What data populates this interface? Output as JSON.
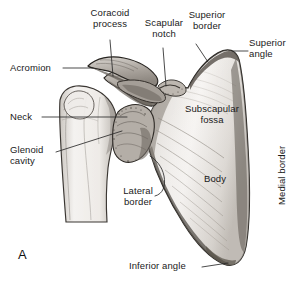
{
  "figure": {
    "panel_letter": "A",
    "background_color": "#ffffff",
    "ink_color": "#1a1a1a",
    "bone_fill": "#f2f0ee",
    "bone_shadow": "#9a958f",
    "leader_color": "#2a2a2a"
  },
  "labels": {
    "coracoid_process": "Coracoid\nprocess",
    "scapular_notch": "Scapular\nnotch",
    "superior_border": "Superior\nborder",
    "superior_angle": "Superior\nangle",
    "acromion": "Acromion",
    "neck": "Neck",
    "glenoid_cavity": "Glenoid\ncavity",
    "subscapular_fossa": "Subscapular\nfossa",
    "body": "Body",
    "medial_border": "Medial border",
    "lateral_border": "Lateral\nborder",
    "inferior_angle": "Inferior angle"
  }
}
